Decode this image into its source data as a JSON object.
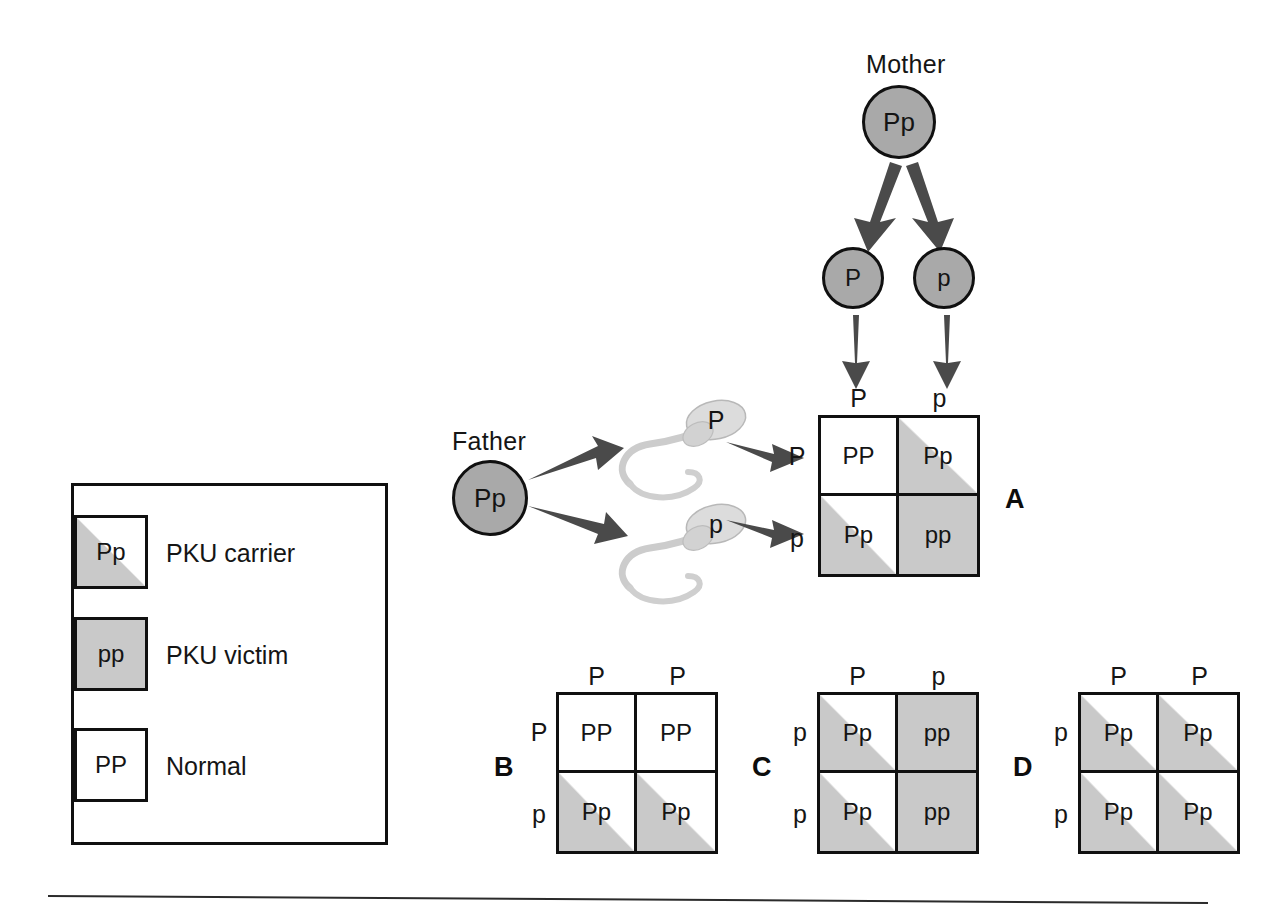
{
  "figure": {
    "title_visible": false,
    "colors": {
      "gamete_circle_fill": "#a9a9a9",
      "punnett_shade": "#c9c9c9",
      "outline": "#101010",
      "arrow_fill": "#4a4a4a",
      "sperm_fill": "#d6d6d6",
      "background": "#ffffff"
    }
  },
  "mother": {
    "label": "Mother",
    "genotype": "Pp",
    "gametes": [
      {
        "allele": "P"
      },
      {
        "allele": "p"
      }
    ]
  },
  "father": {
    "label": "Father",
    "genotype": "Pp",
    "gametes": [
      {
        "allele": "P"
      },
      {
        "allele": "p"
      }
    ]
  },
  "legend": {
    "items": [
      {
        "genotype": "Pp",
        "label": "PKU carrier",
        "shading": "half"
      },
      {
        "genotype": "pp",
        "label": "PKU victim",
        "shading": "full"
      },
      {
        "genotype": "PP",
        "label": "Normal",
        "shading": "none"
      }
    ]
  },
  "squares": [
    {
      "id": "A",
      "panel_label": "A",
      "panel_label_side": "right",
      "col_headers": [
        "P",
        "p"
      ],
      "row_headers": [
        "P",
        "p"
      ],
      "cells": [
        {
          "genotype": "PP",
          "shading": "none"
        },
        {
          "genotype": "Pp",
          "shading": "half"
        },
        {
          "genotype": "Pp",
          "shading": "half"
        },
        {
          "genotype": "pp",
          "shading": "full"
        }
      ]
    },
    {
      "id": "B",
      "panel_label": "B",
      "panel_label_side": "left",
      "col_headers": [
        "P",
        "P"
      ],
      "row_headers": [
        "P",
        "p"
      ],
      "cells": [
        {
          "genotype": "PP",
          "shading": "none"
        },
        {
          "genotype": "PP",
          "shading": "none"
        },
        {
          "genotype": "Pp",
          "shading": "half"
        },
        {
          "genotype": "Pp",
          "shading": "half"
        }
      ]
    },
    {
      "id": "C",
      "panel_label": "C",
      "panel_label_side": "left",
      "col_headers": [
        "P",
        "p"
      ],
      "row_headers": [
        "p",
        "p"
      ],
      "cells": [
        {
          "genotype": "Pp",
          "shading": "half"
        },
        {
          "genotype": "pp",
          "shading": "full"
        },
        {
          "genotype": "Pp",
          "shading": "half"
        },
        {
          "genotype": "pp",
          "shading": "full"
        }
      ]
    },
    {
      "id": "D",
      "panel_label": "D",
      "panel_label_side": "left",
      "col_headers": [
        "P",
        "P"
      ],
      "row_headers": [
        "p",
        "p"
      ],
      "cells": [
        {
          "genotype": "Pp",
          "shading": "half"
        },
        {
          "genotype": "Pp",
          "shading": "half"
        },
        {
          "genotype": "Pp",
          "shading": "half"
        },
        {
          "genotype": "Pp",
          "shading": "half"
        }
      ]
    }
  ]
}
